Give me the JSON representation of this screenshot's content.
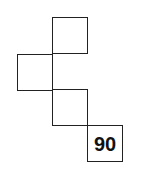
{
  "diagram": {
    "boxes": [
      {
        "id": "box-1",
        "label": "",
        "x": 52,
        "y": 17
      },
      {
        "id": "box-2",
        "label": "",
        "x": 17,
        "y": 54
      },
      {
        "id": "box-3",
        "label": "",
        "x": 52,
        "y": 89
      },
      {
        "id": "box-4",
        "label": "90",
        "x": 87,
        "y": 125
      }
    ],
    "colors": {
      "stroke": "#222222",
      "text": "#111111",
      "background": "#ffffff"
    }
  }
}
